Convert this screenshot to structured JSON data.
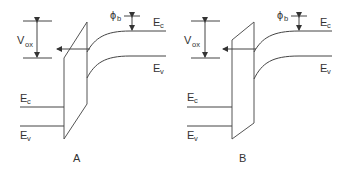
{
  "diagram": {
    "type": "energy-band-diagram",
    "panels": [
      {
        "id": "A",
        "caption": "A",
        "labels": {
          "vox_main": "V",
          "vox_sub": "ox",
          "phi_main": "ϕ",
          "phi_sub": "b",
          "ec_right_main": "E",
          "ec_right_sub": "c",
          "ev_right_main": "E",
          "ev_right_sub": "v",
          "ec_left_main": "E",
          "ec_left_sub": "c",
          "ev_left_main": "E",
          "ev_left_sub": "v"
        }
      },
      {
        "id": "B",
        "caption": "B",
        "labels": {
          "vox_main": "V",
          "vox_sub": "ox",
          "phi_main": "ϕ",
          "phi_sub": "b",
          "ec_right_main": "E",
          "ec_right_sub": "c",
          "ev_right_main": "E",
          "ev_right_sub": "v",
          "ec_left_main": "E",
          "ec_left_sub": "c",
          "ev_left_main": "E",
          "ev_left_sub": "v"
        }
      }
    ],
    "colors": {
      "line": "#444444",
      "text": "#333333",
      "background": "#ffffff"
    }
  }
}
